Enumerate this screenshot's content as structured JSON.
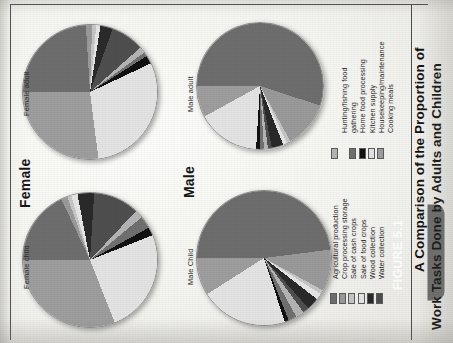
{
  "figure": {
    "tab_label": "FIGURE 5.1",
    "caption_line1": "A Comparison of the Proportion of",
    "caption_line2": "Work Tasks Done by Adults and Children"
  },
  "groups": [
    {
      "key": "female",
      "label": "Female"
    },
    {
      "key": "male",
      "label": "Male"
    }
  ],
  "panels": [
    {
      "key": "female_adult",
      "label": "Female adult"
    },
    {
      "key": "female_child",
      "label": "Female child"
    },
    {
      "key": "male_adult",
      "label": "Male adult"
    },
    {
      "key": "male_child",
      "label": "Male Child"
    }
  ],
  "legends": [
    {
      "key": "legend-top",
      "items": [
        {
          "label": "Hunting/fishing food",
          "color": "#b5b5b5"
        },
        {
          "label": "gathering",
          "color": ""
        },
        {
          "label": "Home food processing",
          "color": "#707070"
        },
        {
          "label": "Kitchen supply",
          "color": "#121212"
        },
        {
          "label": "Housekeeping/maintenance",
          "color": "#e4e4e4"
        },
        {
          "label": "Cooking meals",
          "color": "#9e9e9e"
        }
      ]
    },
    {
      "key": "legend-bottom",
      "items": [
        {
          "label": "Agricultural production",
          "color": "#6e6e6e"
        },
        {
          "label": "Crop processing storage",
          "color": "#9a9a9a"
        },
        {
          "label": "Sale of cash crops",
          "color": "#c6c6c6"
        },
        {
          "label": "Sale of food crops",
          "color": "#e6e6e6"
        },
        {
          "label": "Wood collection",
          "color": "#2a2a2a"
        },
        {
          "label": "Water collection",
          "color": "#4f4f4f"
        }
      ]
    }
  ],
  "chart_data": {
    "type": "pie",
    "legend_position": "right",
    "categories": [
      "Agricultural production",
      "Crop processing storage",
      "Sale of cash crops",
      "Sale of food crops",
      "Wood collection",
      "Water collection",
      "Hunting/fishing food gathering",
      "Home food processing",
      "Kitchen supply",
      "Housekeeping/maintenance",
      "Cooking meals"
    ],
    "colors": [
      "#6e6e6e",
      "#9a9a9a",
      "#c6c6c6",
      "#e6e6e6",
      "#2a2a2a",
      "#4f4f4f",
      "#b5b5b5",
      "#707070",
      "#121212",
      "#e4e4e4",
      "#9e9e9e"
    ],
    "series": [
      {
        "name": "Female adult",
        "values": [
          24.0,
          1.5,
          1.0,
          1.0,
          3.0,
          8.0,
          1.5,
          1.0,
          2.0,
          30.0,
          27.0
        ]
      },
      {
        "name": "Female child",
        "values": [
          18.0,
          1.5,
          1.0,
          1.5,
          4.0,
          11.0,
          2.0,
          3.0,
          2.0,
          25.0,
          31.0
        ]
      },
      {
        "name": "Male adult",
        "values": [
          55.0,
          12.0,
          1.0,
          1.0,
          3.0,
          1.0,
          1.0,
          1.0,
          1.0,
          16.0,
          8.0
        ]
      },
      {
        "name": "Male Child",
        "values": [
          48.0,
          10.0,
          1.0,
          1.5,
          3.0,
          1.5,
          2.0,
          2.0,
          1.0,
          21.0,
          9.0
        ]
      }
    ]
  }
}
